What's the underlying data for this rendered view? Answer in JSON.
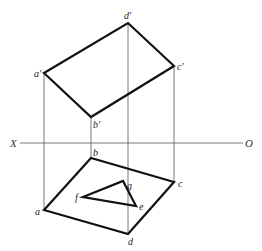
{
  "diagram": {
    "type": "orthographic-projection",
    "axis": {
      "left_label": "X",
      "right_label": "O"
    },
    "front_view": {
      "name": "plane ABCD front projection",
      "vertices": [
        "a'",
        "b'",
        "c'",
        "d'"
      ],
      "labels": {
        "a": "a′",
        "b": "b′",
        "c": "c′",
        "d": "d′"
      }
    },
    "top_view": {
      "name": "plane ABCD top projection",
      "vertices": [
        "a",
        "b",
        "c",
        "d"
      ],
      "labels": {
        "a": "a",
        "b": "b",
        "c": "c",
        "d": "d"
      }
    },
    "triangle": {
      "name": "triangle EFG top projection",
      "vertices": [
        "e",
        "f",
        "g"
      ],
      "labels": {
        "e": "e",
        "f": "f",
        "g": "g"
      }
    }
  }
}
